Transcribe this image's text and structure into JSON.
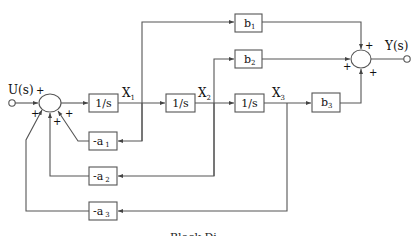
{
  "diagram": {
    "type": "block_diagram",
    "input_label": "U(s)",
    "output_label": "Y(s)",
    "integrators": [
      {
        "label": "1/s",
        "output_state": "X1"
      },
      {
        "label": "1/s",
        "output_state": "X2"
      },
      {
        "label": "1/s",
        "output_state": "X3"
      }
    ],
    "states": {
      "x1": {
        "main": "X",
        "sub": "1"
      },
      "x2": {
        "main": "X",
        "sub": "2"
      },
      "x3": {
        "main": "X",
        "sub": "3"
      }
    },
    "forward_gains": {
      "b1": {
        "main": "b",
        "sub": "1",
        "from": "X1"
      },
      "b2": {
        "main": "b",
        "sub": "2",
        "from": "X2"
      },
      "b3": {
        "main": "b",
        "sub": "3",
        "from": "X3"
      }
    },
    "feedback_gains": {
      "a1": {
        "main": "-a",
        "sub": "1",
        "from": "X1"
      },
      "a2": {
        "main": "-a",
        "sub": "2",
        "from": "X2"
      },
      "a3": {
        "main": "-a",
        "sub": "3",
        "from": "X3"
      }
    },
    "input_junction_signs": [
      "+",
      "+",
      "+",
      "+"
    ],
    "output_junction_signs": [
      "+",
      "+",
      "+"
    ],
    "caption": "Block Di"
  }
}
